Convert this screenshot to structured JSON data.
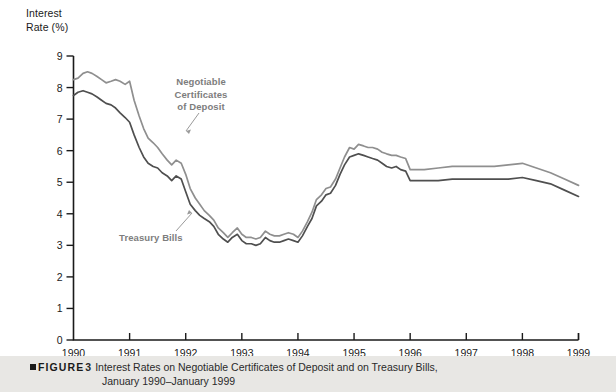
{
  "figure": {
    "tag": "FIGURE",
    "number": "3",
    "caption_line1": "Interest Rates on Negotiable Certificates of Deposit and on Treasury Bills,",
    "caption_line2": "January 1990–January 1999"
  },
  "axis": {
    "y_title": "Interest\nRate (%)",
    "y_ticks": [
      "9",
      "8",
      "7",
      "6",
      "5",
      "4",
      "3",
      "2",
      "1",
      "0"
    ],
    "x_ticks": [
      "1990",
      "1991",
      "1992",
      "1993",
      "1994",
      "1995",
      "1996",
      "1997",
      "1998",
      "1999"
    ]
  },
  "labels": {
    "cd": "Negotiable\nCertificates\nof Deposit",
    "tbill": "Treasury Bills"
  },
  "colors": {
    "cd_line": "#8f8f8f",
    "tbill_line": "#4f4f4f",
    "axis": "#1a1a1a",
    "label_text": "#7d7d7d",
    "caption_band": "#e8e7e4"
  },
  "chart_data": {
    "type": "line",
    "xlabel": "",
    "ylabel": "Interest Rate (%)",
    "xlim": [
      1990,
      1999
    ],
    "ylim": [
      0,
      9
    ],
    "y_tick_step": 1,
    "grid": false,
    "legend": "inline annotations",
    "x_tick_labels": [
      "1990",
      "1991",
      "1992",
      "1993",
      "1994",
      "1995",
      "1996",
      "1997",
      "1998",
      "1999"
    ],
    "series": [
      {
        "name": "Negotiable Certificates of Deposit",
        "color": "#8f8f8f",
        "x": [
          1990.0,
          1990.08,
          1990.17,
          1990.25,
          1990.33,
          1990.42,
          1990.5,
          1990.58,
          1990.67,
          1990.75,
          1990.83,
          1990.92,
          1991.0,
          1991.08,
          1991.17,
          1991.25,
          1991.33,
          1991.42,
          1991.5,
          1991.58,
          1991.67,
          1991.75,
          1991.83,
          1991.92,
          1992.0,
          1992.08,
          1992.17,
          1992.25,
          1992.33,
          1992.42,
          1992.5,
          1992.58,
          1992.67,
          1992.75,
          1992.83,
          1992.92,
          1993.0,
          1993.08,
          1993.17,
          1993.25,
          1993.33,
          1993.42,
          1993.5,
          1993.58,
          1993.67,
          1993.75,
          1993.83,
          1993.92,
          1994.0,
          1994.08,
          1994.17,
          1994.25,
          1994.33,
          1994.42,
          1994.5,
          1994.58,
          1994.67,
          1994.75,
          1994.83,
          1994.92,
          1995.0,
          1995.08,
          1995.17,
          1995.25,
          1995.33,
          1995.42,
          1995.5,
          1995.58,
          1995.67,
          1995.75,
          1995.83,
          1995.92,
          1996.0,
          1996.25,
          1996.5,
          1996.75,
          1997.0,
          1997.25,
          1997.5,
          1997.75,
          1998.0,
          1998.25,
          1998.5,
          1998.75,
          1999.0
        ],
        "y": [
          8.25,
          8.3,
          8.45,
          8.5,
          8.45,
          8.35,
          8.25,
          8.15,
          8.2,
          8.25,
          8.2,
          8.1,
          8.2,
          7.6,
          7.1,
          6.7,
          6.4,
          6.25,
          6.1,
          5.9,
          5.7,
          5.55,
          5.7,
          5.6,
          5.25,
          4.8,
          4.5,
          4.3,
          4.1,
          3.95,
          3.8,
          3.55,
          3.4,
          3.25,
          3.4,
          3.55,
          3.35,
          3.25,
          3.25,
          3.2,
          3.25,
          3.45,
          3.35,
          3.3,
          3.3,
          3.35,
          3.4,
          3.35,
          3.25,
          3.45,
          3.75,
          4.05,
          4.45,
          4.6,
          4.8,
          4.85,
          5.1,
          5.45,
          5.8,
          6.1,
          6.05,
          6.2,
          6.15,
          6.1,
          6.1,
          6.05,
          5.95,
          5.9,
          5.85,
          5.85,
          5.8,
          5.75,
          5.4,
          5.4,
          5.45,
          5.5,
          5.5,
          5.5,
          5.5,
          5.55,
          5.6,
          5.45,
          5.3,
          5.1,
          4.9
        ]
      },
      {
        "name": "Treasury Bills",
        "color": "#4f4f4f",
        "x": [
          1990.0,
          1990.08,
          1990.17,
          1990.25,
          1990.33,
          1990.42,
          1990.5,
          1990.58,
          1990.67,
          1990.75,
          1990.83,
          1990.92,
          1991.0,
          1991.08,
          1991.17,
          1991.25,
          1991.33,
          1991.42,
          1991.5,
          1991.58,
          1991.67,
          1991.75,
          1991.83,
          1991.92,
          1992.0,
          1992.08,
          1992.17,
          1992.25,
          1992.33,
          1992.42,
          1992.5,
          1992.58,
          1992.67,
          1992.75,
          1992.83,
          1992.92,
          1993.0,
          1993.08,
          1993.17,
          1993.25,
          1993.33,
          1993.42,
          1993.5,
          1993.58,
          1993.67,
          1993.75,
          1993.83,
          1993.92,
          1994.0,
          1994.08,
          1994.17,
          1994.25,
          1994.33,
          1994.42,
          1994.5,
          1994.58,
          1994.67,
          1994.75,
          1994.83,
          1994.92,
          1995.0,
          1995.08,
          1995.17,
          1995.25,
          1995.33,
          1995.42,
          1995.5,
          1995.58,
          1995.67,
          1995.75,
          1995.83,
          1995.92,
          1996.0,
          1996.25,
          1996.5,
          1996.75,
          1997.0,
          1997.25,
          1997.5,
          1997.75,
          1998.0,
          1998.25,
          1998.5,
          1998.75,
          1999.0
        ],
        "y": [
          7.75,
          7.85,
          7.9,
          7.85,
          7.8,
          7.7,
          7.6,
          7.5,
          7.45,
          7.35,
          7.2,
          7.05,
          6.9,
          6.5,
          6.1,
          5.8,
          5.6,
          5.5,
          5.45,
          5.3,
          5.2,
          5.05,
          5.2,
          5.1,
          4.7,
          4.3,
          4.1,
          3.95,
          3.85,
          3.75,
          3.6,
          3.35,
          3.2,
          3.1,
          3.25,
          3.35,
          3.15,
          3.05,
          3.05,
          3.0,
          3.05,
          3.25,
          3.15,
          3.1,
          3.1,
          3.15,
          3.2,
          3.15,
          3.1,
          3.3,
          3.6,
          3.85,
          4.25,
          4.4,
          4.6,
          4.65,
          4.9,
          5.25,
          5.55,
          5.8,
          5.85,
          5.9,
          5.85,
          5.8,
          5.75,
          5.7,
          5.6,
          5.5,
          5.45,
          5.5,
          5.4,
          5.35,
          5.05,
          5.05,
          5.05,
          5.1,
          5.1,
          5.1,
          5.1,
          5.1,
          5.15,
          5.05,
          4.95,
          4.75,
          4.55
        ]
      }
    ]
  }
}
